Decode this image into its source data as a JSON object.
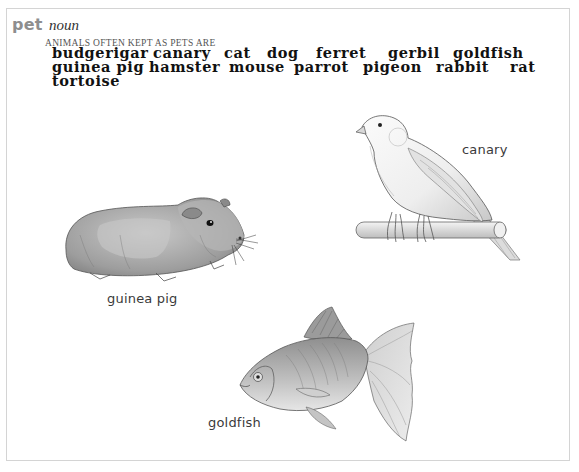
{
  "entry": {
    "headword": "pet",
    "part_of_speech": "noun",
    "category": "ANIMALS OFTEN KEPT AS PETS ARE",
    "words": [
      "budgerigar",
      "canary",
      "cat",
      "dog",
      "ferret",
      "gerbil",
      "goldfish",
      "guinea pig",
      "hamster",
      "mouse",
      "parrot",
      "pigeon",
      "rabbit",
      "rat",
      "tortoise"
    ]
  },
  "illustrations": [
    {
      "name": "guinea-pig",
      "caption": "guinea pig"
    },
    {
      "name": "canary",
      "caption": "canary"
    },
    {
      "name": "goldfish",
      "caption": "goldfish"
    }
  ],
  "colors": {
    "frame_border": "#d4d4d4",
    "headword": "#8e8e8e",
    "word_text": "#111111",
    "caption_text": "#3a3a3a"
  }
}
